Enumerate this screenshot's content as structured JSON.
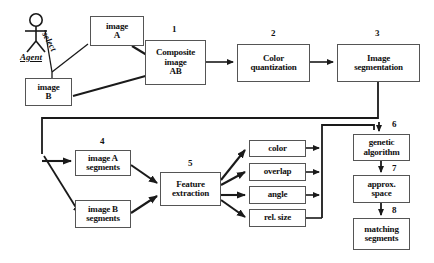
{
  "diagram": {
    "actor": {
      "name": "agent-actor",
      "label": "Agent",
      "relation_label": "select"
    },
    "nodes": [
      {
        "id": "image-a",
        "lines": [
          "image",
          "A"
        ],
        "number": "",
        "x": 90,
        "y": 16,
        "w": 54,
        "h": 30,
        "font": 9
      },
      {
        "id": "image-b",
        "lines": [
          "image",
          "B"
        ],
        "number": "",
        "x": 25,
        "y": 78,
        "w": 47,
        "h": 28,
        "font": 9
      },
      {
        "id": "composite-image-ab",
        "lines": [
          "Composite",
          "image",
          "AB"
        ],
        "number": "1",
        "x": 145,
        "y": 40,
        "w": 61,
        "h": 45,
        "font": 9
      },
      {
        "id": "color-quantization",
        "lines": [
          "Color",
          "quantization"
        ],
        "number": "2",
        "x": 237,
        "y": 44,
        "w": 73,
        "h": 38,
        "font": 9
      },
      {
        "id": "image-segmentation",
        "lines": [
          "Image",
          "segmentation"
        ],
        "number": "3",
        "x": 337,
        "y": 44,
        "w": 83,
        "h": 38,
        "font": 9
      },
      {
        "id": "image-a-segments",
        "lines": [
          "image A",
          "segments"
        ],
        "number": "4",
        "x": 75,
        "y": 150,
        "w": 56,
        "h": 26,
        "font": 9
      },
      {
        "id": "image-b-segments",
        "lines": [
          "image B",
          "segments"
        ],
        "number": "",
        "x": 75,
        "y": 200,
        "w": 56,
        "h": 28,
        "font": 9
      },
      {
        "id": "feature-extraction",
        "lines": [
          "Feature",
          "extraction"
        ],
        "number": "5",
        "x": 160,
        "y": 172,
        "w": 61,
        "h": 34,
        "font": 9
      },
      {
        "id": "feature-color",
        "lines": [
          "color"
        ],
        "number": "",
        "x": 249,
        "y": 140,
        "w": 57,
        "h": 17,
        "font": 9
      },
      {
        "id": "feature-overlap",
        "lines": [
          "overlap"
        ],
        "number": "",
        "x": 249,
        "y": 163,
        "w": 57,
        "h": 18,
        "font": 9
      },
      {
        "id": "feature-angle",
        "lines": [
          "angle"
        ],
        "number": "",
        "x": 249,
        "y": 186,
        "w": 57,
        "h": 18,
        "font": 9
      },
      {
        "id": "feature-rel-size",
        "lines": [
          "rel. size"
        ],
        "number": "",
        "x": 249,
        "y": 209,
        "w": 57,
        "h": 18,
        "font": 9
      },
      {
        "id": "genetic-algorithm",
        "lines": [
          "genetic",
          "algorithm"
        ],
        "number": "6",
        "x": 353,
        "y": 134,
        "w": 57,
        "h": 27,
        "font": 9
      },
      {
        "id": "approx-space",
        "lines": [
          "approx.",
          "space"
        ],
        "number": "7",
        "x": 353,
        "y": 175,
        "w": 57,
        "h": 28,
        "font": 9
      },
      {
        "id": "matching-segments",
        "lines": [
          "matching",
          "segments"
        ],
        "number": "8",
        "x": 353,
        "y": 218,
        "w": 57,
        "h": 32,
        "font": 9
      }
    ],
    "numbers": [
      {
        "id": "step-1",
        "text": "1",
        "x": 172,
        "y": 24
      },
      {
        "id": "step-2",
        "text": "2",
        "x": 271,
        "y": 28
      },
      {
        "id": "step-3",
        "text": "3",
        "x": 375,
        "y": 28
      },
      {
        "id": "step-4",
        "text": "4",
        "x": 100,
        "y": 136
      },
      {
        "id": "step-5",
        "text": "5",
        "x": 188,
        "y": 158
      },
      {
        "id": "step-6",
        "text": "6",
        "x": 392,
        "y": 119
      },
      {
        "id": "step-7",
        "text": "7",
        "x": 392,
        "y": 163
      },
      {
        "id": "step-8",
        "text": "8",
        "x": 392,
        "y": 205
      }
    ],
    "colors": {
      "line": "#1a1a1a",
      "box_border": "#555555",
      "background": "#ffffff",
      "text": "#111111"
    }
  }
}
